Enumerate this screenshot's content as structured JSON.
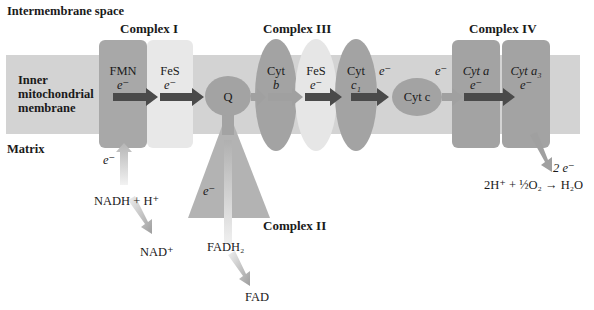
{
  "regions": {
    "intermembrane": "Intermembrane space",
    "inner_membrane": [
      "Inner",
      "mitochondrial",
      "membrane"
    ],
    "matrix": "Matrix"
  },
  "complexes": {
    "complex1": {
      "label": "Complex I",
      "parts": [
        {
          "name": "FMN",
          "carrier": "e⁻"
        },
        {
          "name": "FeS",
          "carrier": "e⁻"
        }
      ]
    },
    "complex2": {
      "label": "Complex II",
      "carrier": "e⁻"
    },
    "complex3": {
      "label": "Complex III",
      "parts": [
        {
          "name": "Cyt",
          "sub": "b"
        },
        {
          "name": "FeS",
          "carrier": "e⁻"
        },
        {
          "name": "Cyt",
          "sub": "c₁"
        }
      ]
    },
    "complex4": {
      "label": "Complex IV",
      "parts": [
        {
          "name": "Cyt a",
          "carrier": "e⁻"
        },
        {
          "name": "Cyt a₃",
          "carrier": "e⁻"
        }
      ]
    }
  },
  "carriers": {
    "q": "Q",
    "cytc": "Cyt c",
    "e_between_c1_cytc": "e⁻",
    "e_between_cytc_c4": "e⁻"
  },
  "matrix_reactions": {
    "nadh_e": "e⁻",
    "nadh": "NADH + H⁺",
    "nad": "NAD⁺",
    "fadh2": "FADH₂",
    "fad": "FAD",
    "two_e": "2 e⁻",
    "oxygen_reaction": "2H⁺ + ½O₂ → H₂O"
  },
  "colors": {
    "membrane": "#d3d3d3",
    "dark_component": "#a3a3a3",
    "light_component": "#e6e6e6",
    "arrow_dark": "#4a4a4a",
    "arrow_light": "#9e9e9e"
  }
}
